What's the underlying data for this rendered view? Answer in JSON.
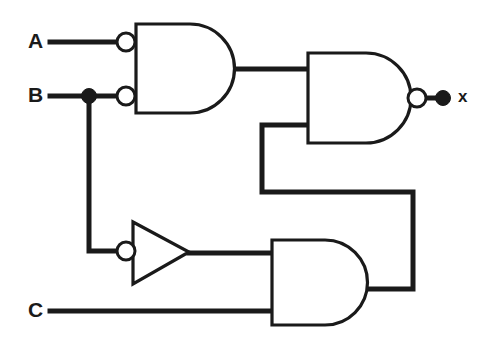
{
  "diagram": {
    "type": "logic-gate-schematic",
    "background_color": "#ffffff",
    "line_color": "#1a1a1a"
  },
  "labels": {
    "input_a": "A",
    "input_b": "B",
    "input_c": "C",
    "output_x": "x"
  },
  "inputs": [
    {
      "id": "A",
      "label": "A",
      "x": 30,
      "y": 42
    },
    {
      "id": "B",
      "label": "B",
      "x": 30,
      "y": 96
    },
    {
      "id": "C",
      "label": "C",
      "x": 30,
      "y": 311
    }
  ],
  "outputs": [
    {
      "id": "x",
      "label": "x",
      "x": 462,
      "y": 98
    }
  ],
  "gates": [
    {
      "id": "gate1",
      "name": "and-gate-inverted-inputs",
      "shape": "and",
      "input_bubbles": true,
      "output_bubble": false,
      "body_x": 136,
      "body_y": 24,
      "body_w": 99,
      "body_h": 89,
      "inputs": [
        "A",
        "B"
      ],
      "output_to": "gate2"
    },
    {
      "id": "gate2",
      "name": "nand-gate",
      "shape": "and",
      "input_bubbles": false,
      "output_bubble": true,
      "body_x": 308,
      "body_y": 53,
      "body_w": 103,
      "body_h": 90,
      "inputs": [
        "gate1",
        "gate3"
      ],
      "output_to": "x"
    },
    {
      "id": "inverter",
      "name": "inverter-bubble-input",
      "shape": "triangle",
      "input_bubbles": true,
      "output_bubble": false,
      "body_x": 133,
      "body_y": 222,
      "body_w": 56,
      "body_h": 62,
      "inputs": [
        "B"
      ],
      "output_to": "gate3"
    },
    {
      "id": "gate3",
      "name": "and-gate",
      "shape": "and",
      "input_bubbles": false,
      "output_bubble": false,
      "body_x": 272,
      "body_y": 240,
      "body_w": 96,
      "body_h": 85,
      "inputs": [
        "inverter",
        "C"
      ],
      "output_to": "gate2"
    }
  ],
  "junctions": [
    {
      "id": "b-tap",
      "name": "b-branch-junction",
      "x": 89,
      "y": 96,
      "r": 7
    }
  ],
  "terminals": [
    {
      "id": "x-terminal",
      "name": "output-terminal-dot",
      "x": 443,
      "y": 98,
      "r": 7
    }
  ],
  "bubbles": [
    {
      "id": "bubble-a",
      "name": "input-bubble-a",
      "x": 126,
      "y": 42,
      "r": 9
    },
    {
      "id": "bubble-b",
      "name": "input-bubble-b",
      "x": 126,
      "y": 96,
      "r": 9
    },
    {
      "id": "bubble-inv",
      "name": "inverter-input-bubble",
      "x": 126,
      "y": 251,
      "r": 9
    },
    {
      "id": "bubble-out",
      "name": "nand-output-bubble",
      "x": 417,
      "y": 98,
      "r": 9
    }
  ],
  "wires": [
    {
      "id": "w-a",
      "name": "wire-a-to-gate1",
      "path": "M 50 42 L 117 42"
    },
    {
      "id": "w-b",
      "name": "wire-b-to-gate1",
      "path": "M 50 96 L 117 96"
    },
    {
      "id": "w-b-branch",
      "name": "wire-b-branch-to-inverter",
      "path": "M 89 96 L 89 251 L 117 251"
    },
    {
      "id": "w-g1-g2",
      "name": "wire-gate1-to-nand",
      "path": "M 235 69 L 308 69"
    },
    {
      "id": "w-g2-out",
      "name": "wire-nand-to-output",
      "path": "M 426 98 L 443 98"
    },
    {
      "id": "w-inv-g3",
      "name": "wire-inverter-to-and",
      "path": "M 189 253 L 272 253"
    },
    {
      "id": "w-c",
      "name": "wire-c-to-and",
      "path": "M 50 311 L 272 311"
    },
    {
      "id": "w-feedback",
      "name": "wire-and-feedback-to-nand",
      "path": "M 368 289 L 413 289 L 413 192 L 262 192 L 262 125 L 308 125"
    }
  ]
}
